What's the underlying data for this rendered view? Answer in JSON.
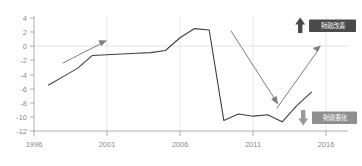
{
  "chart_data": {
    "type": "line",
    "title": "",
    "subtitle": "",
    "xlabel": "",
    "ylabel": "",
    "xlim": [
      1996,
      2016
    ],
    "ylim": [
      -12,
      4
    ],
    "grid": true,
    "legend_position": "none",
    "x_tick_labels": [
      "1996",
      "2001",
      "2006",
      "2011",
      "2016"
    ],
    "x_ticks": [
      1996,
      2001,
      2006,
      2011,
      2016
    ],
    "y_tick_labels": [
      "4",
      "2",
      "0",
      "-2",
      "-4",
      "-6",
      "-8",
      "-10",
      "-12"
    ],
    "y_ticks": [
      4,
      2,
      0,
      -2,
      -4,
      -6,
      -8,
      -10,
      -12
    ],
    "series": [
      {
        "name": "fiscal-balance",
        "color": "#3f3f3f",
        "x": [
          1997,
          1998,
          1999,
          2000,
          2001,
          2002,
          2003,
          2004,
          2005,
          2006,
          2007,
          2008,
          2009,
          2010,
          2011,
          2012,
          2013,
          2014,
          2015
        ],
        "values": [
          -5.5,
          -4.3,
          -3.1,
          -1.3,
          -1.2,
          -1.1,
          -1.0,
          -0.9,
          -0.6,
          1.2,
          2.5,
          2.3,
          -10.5,
          -9.6,
          -9.9,
          -9.7,
          -10.7,
          -8.4,
          -6.5
        ]
      }
    ],
    "annotations": [
      {
        "name": "trend-arrow-early-rise",
        "kind": "arrow",
        "from_x": 1998.0,
        "from_y": -2.2,
        "to_x": 2000.6,
        "to_y": 0.6,
        "color": "#7d7d7d"
      },
      {
        "name": "trend-arrow-crash",
        "kind": "arrow",
        "from_x": 2007.4,
        "from_y": 2.1,
        "to_x": 2010.7,
        "to_y": -7.6,
        "color": "#7d7d7d"
      },
      {
        "name": "trend-arrow-recovery",
        "kind": "arrow",
        "from_x": 2012.6,
        "from_y": -8.6,
        "to_x": 2015.6,
        "to_y": -0.6,
        "color": "#7d7d7d"
      },
      {
        "name": "label-fiscal-improvement",
        "kind": "label",
        "text": "財政改善",
        "direction": "up",
        "box_color": "#4a4a4a",
        "text_color": "#ffffff"
      },
      {
        "name": "label-fiscal-deterioration",
        "kind": "label",
        "text": "財政悪化",
        "direction": "down",
        "box_color": "#8f8f8f",
        "text_color": "#ffffff"
      }
    ]
  },
  "labels": {
    "improvement": "財政改善",
    "deterioration": "財政悪化"
  }
}
